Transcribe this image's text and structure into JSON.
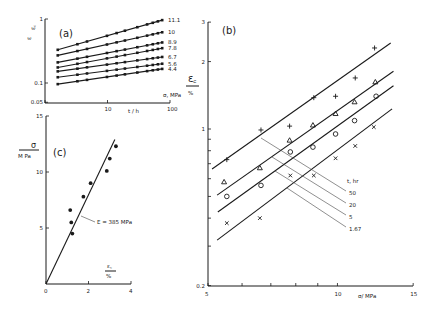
{
  "chart_data": [
    {
      "panel": "(a)",
      "type": "line",
      "xscale": "log",
      "yscale": "log",
      "xlabel": "t / h",
      "ylabel": "ε / ε_c",
      "xlim": [
        1,
        100
      ],
      "ylim": [
        0.05,
        1
      ],
      "xticks": [
        {
          "v": 1,
          "label": ""
        },
        {
          "v": 10,
          "label": "10"
        },
        {
          "v": 100,
          "label": "100"
        }
      ],
      "yticks": [
        {
          "v": 0.05,
          "label": "0.05"
        },
        {
          "v": 0.1,
          "label": "0.1"
        },
        {
          "v": 1,
          "label": "1"
        }
      ],
      "legend_title": "σ, MPa",
      "x": [
        1.6,
        3.3,
        4.7,
        9.8,
        14,
        19,
        30,
        43,
        53,
        64,
        75
      ],
      "series": [
        {
          "name": "11.1",
          "start": 0.33,
          "end": 0.96
        },
        {
          "name": "10",
          "start": 0.27,
          "end": 0.62
        },
        {
          "name": "8.9",
          "start": 0.21,
          "end": 0.43
        },
        {
          "name": "7.8",
          "start": 0.175,
          "end": 0.35
        },
        {
          "name": "6.7",
          "start": 0.152,
          "end": 0.255
        },
        {
          "name": "5.6",
          "start": 0.123,
          "end": 0.2
        },
        {
          "name": "4.4",
          "start": 0.096,
          "end": 0.166
        }
      ]
    },
    {
      "panel": "(c)",
      "type": "scatter",
      "xlabel": "ε_s / %",
      "ylabel": "σ / MPa",
      "xlim": [
        0,
        4
      ],
      "ylim": [
        0,
        15
      ],
      "xticks": [
        {
          "v": 0,
          "label": "0"
        },
        {
          "v": 2,
          "label": "2"
        },
        {
          "v": 4,
          "label": "4"
        }
      ],
      "yticks": [
        {
          "v": 5,
          "label": "5"
        },
        {
          "v": 10,
          "label": "10"
        },
        {
          "v": 15,
          "label": "15"
        }
      ],
      "points": [
        {
          "x": 3.29,
          "y": 12.3
        },
        {
          "x": 3.0,
          "y": 11.2
        },
        {
          "x": 2.86,
          "y": 10.1
        },
        {
          "x": 2.1,
          "y": 9.0
        },
        {
          "x": 1.76,
          "y": 7.8
        },
        {
          "x": 1.14,
          "y": 6.6
        },
        {
          "x": 1.19,
          "y": 5.5
        },
        {
          "x": 1.24,
          "y": 4.5
        }
      ],
      "fit_line": {
        "x": [
          0,
          3.24
        ],
        "y": [
          0,
          12.9
        ]
      },
      "annotation": "E = 385 MPa"
    },
    {
      "panel": "(b)",
      "type": "scatter",
      "xscale": "log",
      "yscale": "log",
      "xlabel": "σ / MPa",
      "ylabel": "ε_c / %",
      "xlim": [
        5,
        15
      ],
      "ylim": [
        0.2,
        3
      ],
      "xticks": [
        {
          "v": 5,
          "label": "5"
        },
        {
          "v": 6,
          "label": ""
        },
        {
          "v": 7,
          "label": ""
        },
        {
          "v": 8,
          "label": ""
        },
        {
          "v": 9,
          "label": ""
        },
        {
          "v": 10,
          "label": "10"
        },
        {
          "v": 15,
          "label": "15"
        }
      ],
      "yticks": [
        {
          "v": 0.2,
          "label": "0.2"
        },
        {
          "v": 0.3,
          "label": ""
        },
        {
          "v": 0.4,
          "label": ""
        },
        {
          "v": 0.5,
          "label": ""
        },
        {
          "v": 0.6,
          "label": ""
        },
        {
          "v": 0.7,
          "label": ""
        },
        {
          "v": 0.8,
          "label": ""
        },
        {
          "v": 0.9,
          "label": ""
        },
        {
          "v": 1,
          "label": "1"
        },
        {
          "v": 2,
          "label": "2"
        },
        {
          "v": 3,
          "label": "3"
        }
      ],
      "legend_title": "t, hr",
      "series": [
        {
          "name": "50",
          "marker": "plus",
          "x": [
            5.53,
            6.64,
            7.74,
            8.81,
            9.9,
            11.0,
            12.2
          ],
          "y": [
            0.73,
            0.99,
            1.03,
            1.38,
            1.4,
            1.69,
            2.3
          ],
          "line": {
            "x": [
              5.11,
              13.3
            ],
            "y": [
              0.663,
              2.42
            ]
          }
        },
        {
          "name": "20",
          "marker": "triangle",
          "x": [
            5.45,
            6.6,
            7.74,
            8.77,
            9.9,
            10.96,
            12.25
          ],
          "y": [
            0.58,
            0.67,
            0.89,
            1.04,
            1.17,
            1.32,
            1.62
          ],
          "line": {
            "x": [
              5.25,
              13.5
            ],
            "y": [
              0.507,
              1.81
            ]
          }
        },
        {
          "name": "5",
          "marker": "circle",
          "x": [
            5.53,
            6.64,
            7.77,
            8.77,
            9.9,
            10.96,
            12.3
          ],
          "y": [
            0.5,
            0.56,
            0.79,
            0.83,
            0.95,
            1.09,
            1.4
          ],
          "line": {
            "x": [
              5.27,
              13.5
            ],
            "y": [
              0.426,
              1.56
            ]
          }
        },
        {
          "name": "1.67",
          "marker": "cross",
          "x": [
            5.53,
            6.6,
            7.77,
            8.81,
            9.9,
            11.0,
            12.15
          ],
          "y": [
            0.38,
            0.4,
            0.62,
            0.62,
            0.74,
            0.84,
            1.02
          ],
          "line": {
            "x": [
              5.25,
              13.4
            ],
            "y": [
              0.319,
              1.23
            ]
          }
        }
      ]
    }
  ],
  "labels": {
    "panel_a": "(a)",
    "panel_b": "(b)",
    "panel_c": "(c)",
    "a_ylabel_num": "ε",
    "a_ylabel_den": "ε꜀",
    "a_xlabel": "t / h",
    "a_legend_title": "σ, MPa",
    "b_ylabel_num": "ε꜀",
    "b_ylabel_den": "%",
    "b_xlabel": "σ/ MPa",
    "b_legend_title": "t, hr",
    "c_ylabel_num": "σ",
    "c_ylabel_den": "M Pa",
    "c_xlabel_num": "ε꜀",
    "c_xlabel_den": "%",
    "c_annotation": "E = 385 MPa"
  }
}
